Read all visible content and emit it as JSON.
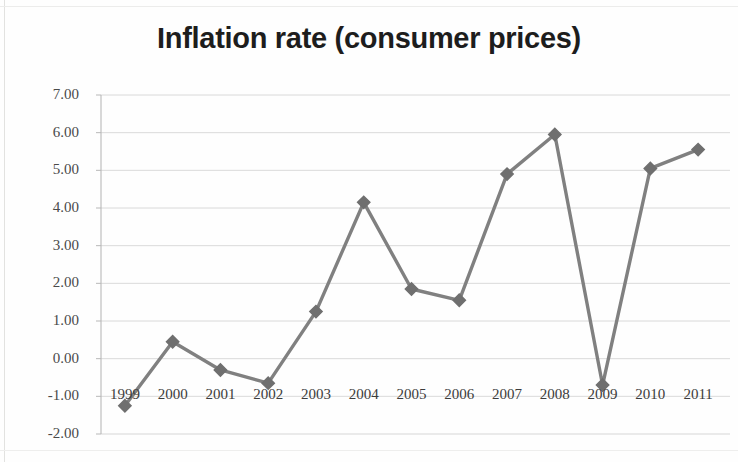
{
  "chart_data": {
    "type": "line",
    "title": "Inflation rate (consumer prices)",
    "xlabel": "",
    "ylabel": "",
    "categories": [
      "1999",
      "2000",
      "2001",
      "2002",
      "2003",
      "2004",
      "2005",
      "2006",
      "2007",
      "2008",
      "2009",
      "2010",
      "2011"
    ],
    "values": [
      -1.25,
      0.45,
      -0.3,
      -0.65,
      1.25,
      4.15,
      1.85,
      1.55,
      4.9,
      5.95,
      -0.7,
      5.05,
      5.55
    ],
    "series": [
      {
        "name": "Inflation rate (consumer prices)",
        "values": [
          -1.25,
          0.45,
          -0.3,
          -0.65,
          1.25,
          4.15,
          1.85,
          1.55,
          4.9,
          5.95,
          -0.7,
          5.05,
          5.55
        ]
      }
    ],
    "ylim": [
      -2.0,
      7.0
    ],
    "ytick_labels": [
      "7.00",
      "6.00",
      "5.00",
      "4.00",
      "3.00",
      "2.00",
      "1.00",
      "0.00",
      "-1.00",
      "-2.00"
    ],
    "ytick_values": [
      7.0,
      6.0,
      5.0,
      4.0,
      3.0,
      2.0,
      1.0,
      0.0,
      -1.0,
      -2.0
    ],
    "grid": true,
    "legend": "none",
    "marker": "diamond",
    "colors": {
      "series_line": "#808080",
      "marker": "#6f6f6f",
      "grid": "#d6d6d6",
      "axis": "#b8b8b8",
      "title_text": "#1d1d1d",
      "tick_text": "#444444",
      "background": "#fefefe"
    }
  }
}
